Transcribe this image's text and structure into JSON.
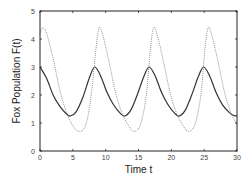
{
  "chart_data": {
    "type": "line",
    "title": "",
    "xlabel": "Time t",
    "ylabel": "Fox Population F(t)",
    "xlim": [
      0,
      30
    ],
    "ylim": [
      0,
      5
    ],
    "xticks": [
      "0",
      "5",
      "10",
      "15",
      "20",
      "25",
      "30"
    ],
    "yticks": [
      "0",
      "1",
      "2",
      "3",
      "4",
      "5"
    ],
    "grid": false,
    "legend": null,
    "series": [
      {
        "name": "F(t) solid",
        "style": "solid",
        "color": "#333333",
        "x": [
          0,
          1,
          2,
          3,
          4,
          4.6,
          5.5,
          6.5,
          7.5,
          8.3,
          9.2,
          10.2,
          11.2,
          12.2,
          12.9,
          13.8,
          14.8,
          15.8,
          16.6,
          17.5,
          18.5,
          19.5,
          20.5,
          21.2,
          22.1,
          23.1,
          24.1,
          24.9,
          25.8,
          26.8,
          27.8,
          28.8,
          29.5,
          30
        ],
        "y": [
          3.0,
          2.6,
          2.0,
          1.6,
          1.33,
          1.25,
          1.4,
          1.9,
          2.6,
          3.0,
          2.7,
          2.1,
          1.65,
          1.35,
          1.25,
          1.45,
          2.0,
          2.65,
          3.0,
          2.7,
          2.1,
          1.65,
          1.35,
          1.25,
          1.45,
          2.0,
          2.65,
          3.0,
          2.7,
          2.1,
          1.65,
          1.38,
          1.27,
          1.25
        ]
      },
      {
        "name": "second species dotted",
        "style": "dotted",
        "color": "#888888",
        "x": [
          0,
          0.4,
          1,
          2,
          3,
          4,
          5,
          6,
          7,
          7.8,
          8.5,
          9.0,
          9.6,
          10.5,
          11.5,
          12.5,
          13.5,
          14.3,
          15.3,
          16.2,
          16.8,
          17.3,
          17.9,
          18.8,
          19.8,
          20.8,
          21.8,
          22.6,
          23.6,
          24.5,
          25.1,
          25.6,
          26.2,
          27.1,
          28.1,
          29.1,
          30
        ],
        "y": [
          4.2,
          4.4,
          4.2,
          3.3,
          2.2,
          1.4,
          0.9,
          0.7,
          0.95,
          2.0,
          3.6,
          4.4,
          4.1,
          3.2,
          2.1,
          1.35,
          0.9,
          0.7,
          0.95,
          2.0,
          3.6,
          4.4,
          4.1,
          3.2,
          2.1,
          1.35,
          0.9,
          0.7,
          0.95,
          2.0,
          3.6,
          4.4,
          4.1,
          3.2,
          2.1,
          1.35,
          0.95
        ]
      }
    ]
  }
}
